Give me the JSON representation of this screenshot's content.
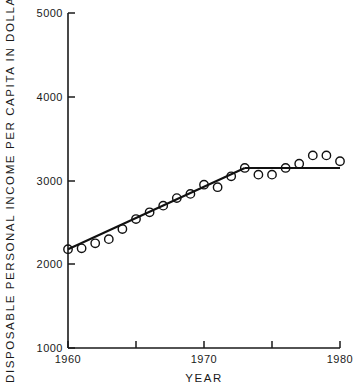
{
  "chart_data": {
    "type": "scatter",
    "title": "",
    "xlabel": "YEAR",
    "ylabel": "DISPOSABLE  PERSONAL  INCOME  PER  CAPITA  IN  DOLLARS",
    "xlim": [
      1959,
      1981
    ],
    "ylim": [
      1000,
      5000
    ],
    "grid": false,
    "legend": "none",
    "x_ticks": [
      1960,
      1965,
      1970,
      1975,
      1980
    ],
    "x_tick_labels": [
      "1960",
      "",
      "1970",
      "",
      "1980"
    ],
    "y_ticks": [
      1000,
      2000,
      3000,
      4000,
      5000
    ],
    "y_tick_labels": [
      "1000",
      "2000",
      "3000",
      "4000",
      "5000"
    ],
    "marker": "open-circle",
    "x": [
      1960,
      1961,
      1962,
      1963,
      1964,
      1965,
      1966,
      1967,
      1968,
      1969,
      1970,
      1971,
      1972,
      1973,
      1974,
      1975,
      1976,
      1977,
      1978,
      1979,
      1980
    ],
    "values": [
      2180,
      2190,
      2250,
      2300,
      2420,
      2540,
      2620,
      2700,
      2790,
      2840,
      2950,
      2920,
      3050,
      3150,
      3070,
      3070,
      3150,
      3200,
      3300,
      3300,
      3230
    ],
    "series": [
      {
        "name": "Disposable personal income per capita",
        "values": [
          2180,
          2190,
          2250,
          2300,
          2420,
          2540,
          2620,
          2700,
          2790,
          2840,
          2950,
          2920,
          3050,
          3150,
          3070,
          3070,
          3150,
          3200,
          3300,
          3300,
          3230
        ]
      }
    ],
    "fit_lines": [
      {
        "name": "rising-segment",
        "x": [
          1960,
          1973
        ],
        "y": [
          2180,
          3150
        ]
      },
      {
        "name": "plateau-segment",
        "x": [
          1973,
          1980
        ],
        "y": [
          3150,
          3150
        ]
      }
    ]
  }
}
